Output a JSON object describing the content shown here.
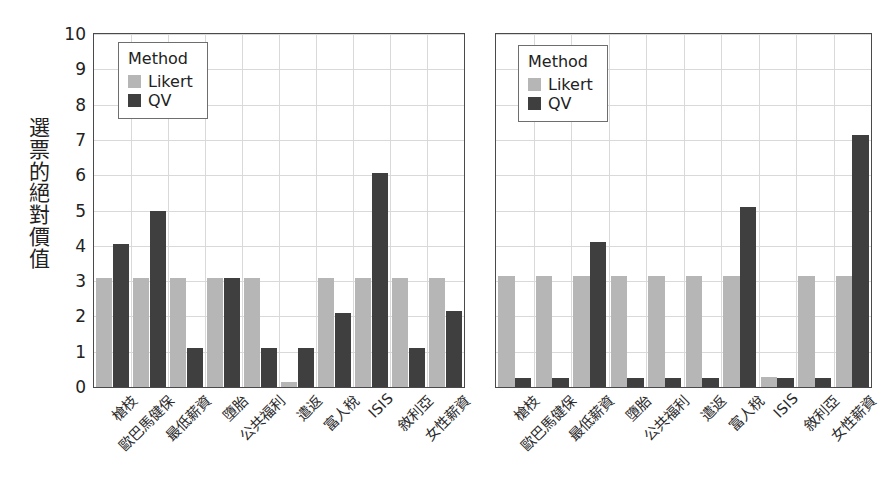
{
  "chart_data": {
    "type": "bar",
    "title": "",
    "subtitle": "",
    "xlabel": "",
    "ylabel": "選票的絕對價值",
    "ylim": [
      0,
      10
    ],
    "yticks": [
      0,
      1,
      2,
      3,
      4,
      5,
      6,
      7,
      8,
      9,
      10
    ],
    "grid": true,
    "legend": {
      "title": "Method",
      "position": "top-left",
      "entries": [
        {
          "name": "Likert",
          "color": "#b6b6b6"
        },
        {
          "name": "QV",
          "color": "#3f3f3f"
        }
      ]
    },
    "categories": [
      "槍枝",
      "歐巴馬健保",
      "最低薪資",
      "墮胎",
      "公共福利",
      "遣返",
      "富人稅",
      "ISIS",
      "敘利亞",
      "女性薪資"
    ],
    "panels": [
      {
        "name": "left-panel",
        "series": [
          {
            "name": "Likert",
            "color": "#b6b6b6",
            "values": [
              3.1,
              3.1,
              3.1,
              3.1,
              3.1,
              0.15,
              3.1,
              3.1,
              3.1,
              3.1
            ]
          },
          {
            "name": "QV",
            "color": "#3f3f3f",
            "values": [
              4.05,
              5.0,
              1.1,
              3.1,
              1.1,
              1.1,
              2.1,
              6.05,
              1.1,
              2.15
            ]
          }
        ]
      },
      {
        "name": "right-panel",
        "series": [
          {
            "name": "Likert",
            "color": "#b6b6b6",
            "values": [
              3.15,
              3.15,
              3.15,
              3.15,
              3.15,
              3.15,
              3.15,
              0.28,
              3.15,
              3.15
            ]
          },
          {
            "name": "QV",
            "color": "#3f3f3f",
            "values": [
              0.25,
              0.25,
              4.1,
              0.25,
              0.25,
              0.25,
              5.1,
              0.25,
              0.25,
              7.15
            ]
          }
        ]
      }
    ]
  },
  "axis": {
    "ytick_labels": [
      "10",
      "9",
      "8",
      "7",
      "6",
      "5",
      "4",
      "3",
      "2",
      "1",
      "0"
    ],
    "ytitle_chars": [
      "選",
      "票",
      "的",
      "絕",
      "對",
      "價",
      "值"
    ]
  },
  "colors": {
    "likert": "#b6b6b6",
    "qv": "#3f3f3f",
    "frame": "#4a4a4a",
    "grid": "#d9d9d9",
    "background": "#ffffff"
  }
}
